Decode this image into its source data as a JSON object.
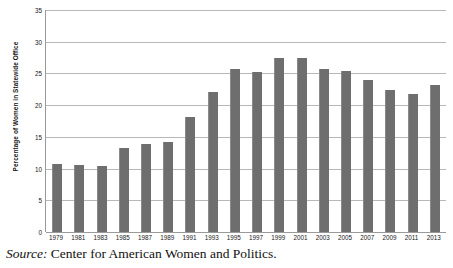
{
  "chart_data": {
    "type": "bar",
    "title": "",
    "xlabel": "",
    "ylabel": "Percentage of Women in Statewide Office",
    "ylim": [
      0,
      35
    ],
    "ytick_step": 5,
    "yticks": [
      35,
      30,
      25,
      20,
      15,
      10,
      5,
      0
    ],
    "grid": "horizontal",
    "legend": "none",
    "bar_color": "#6e6e6e",
    "categories": [
      "1979",
      "1981",
      "1983",
      "1985",
      "1987",
      "1989",
      "1991",
      "1993",
      "1995",
      "1997",
      "1999",
      "2001",
      "2003",
      "2005",
      "2007",
      "2009",
      "2011",
      "2013"
    ],
    "values": [
      10.7,
      10.5,
      10.4,
      13.2,
      13.8,
      14.2,
      18.1,
      22.0,
      25.7,
      25.3,
      27.4,
      27.4,
      25.7,
      25.4,
      23.9,
      22.4,
      21.8,
      23.1
    ]
  },
  "caption": {
    "source_label": "Source:",
    "source_text": " Center for American Women and Politics."
  }
}
